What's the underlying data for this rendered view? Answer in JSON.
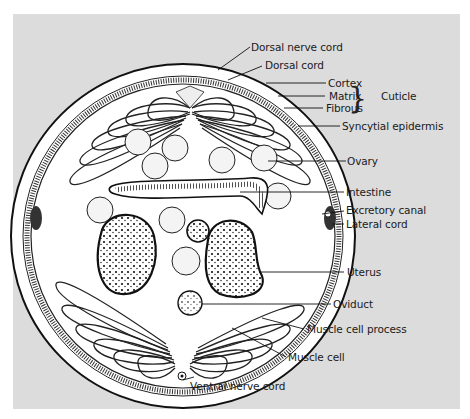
{
  "figure": {
    "background_color": "#dcdcdc",
    "labels": {
      "dorsal_nerve_cord": "Dorsal nerve cord",
      "dorsal_cord": "Dorsal cord",
      "cortex": "Cortex",
      "matrix": "Matrix",
      "fibrous": "Fibrous",
      "cuticle": "Cuticle",
      "syncytial_epidermis": "Syncytial epidermis",
      "ovary": "Ovary",
      "intestine": "Intestine",
      "excretory_canal": "Excretory canal",
      "lateral_cord": "Lateral cord",
      "uterus": "Uterus",
      "oviduct": "Oviduct",
      "muscle_cell_process": "Muscle cell process",
      "muscle_cell": "Muscle cell",
      "ventral_nerve_cord": "Ventral nerve cord"
    },
    "bracket_glyph": "}"
  }
}
